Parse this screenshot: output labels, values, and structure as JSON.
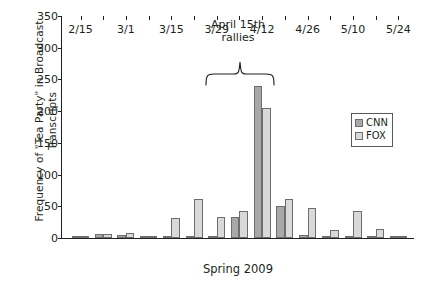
{
  "chart_data": {
    "type": "bar",
    "title": "",
    "xlabel": "Spring 2009",
    "ylabel": "Frequency of \"Tea Party\" in Broadcast Transcripts",
    "ylim": [
      0,
      350
    ],
    "yticks": [
      0,
      50,
      100,
      150,
      200,
      250,
      300,
      350
    ],
    "xticks": [
      "2/15",
      "3/1",
      "3/15",
      "3/29",
      "4/12",
      "4/26",
      "5/10",
      "5/24"
    ],
    "grid": false,
    "legend_position": "right",
    "legend": [
      {
        "name": "CNN",
        "color": "#a8a8a8"
      },
      {
        "name": "FOX",
        "color": "#d9d9d9"
      }
    ],
    "categories": [
      "2/15",
      "2/22",
      "3/1",
      "3/8",
      "3/15",
      "3/22",
      "3/29",
      "4/5",
      "4/12",
      "4/19",
      "4/26",
      "5/3",
      "5/10",
      "5/17",
      "5/24"
    ],
    "series": [
      {
        "name": "CNN",
        "color": "#a8a8a8",
        "values": [
          3,
          6,
          5,
          2,
          1,
          2,
          2,
          33,
          240,
          50,
          4,
          1,
          1,
          2,
          1
        ]
      },
      {
        "name": "FOX",
        "color": "#d9d9d9",
        "values": [
          1,
          7,
          8,
          2,
          31,
          61,
          33,
          43,
          205,
          62,
          48,
          12,
          42,
          15,
          1
        ]
      }
    ],
    "annotations": [
      {
        "text_line1": "April 15th",
        "text_line2": "rallies",
        "type": "brace",
        "spans": [
          "4/12 group"
        ]
      }
    ]
  },
  "axis": {
    "y_label": "Frequency of \"Tea Party\" in Broadcast Transcripts",
    "x_label": "Spring 2009"
  },
  "annotation": {
    "line1": "April 15th",
    "line2": "rallies"
  },
  "legend": {
    "cnn_label": "CNN",
    "fox_label": "FOX"
  }
}
